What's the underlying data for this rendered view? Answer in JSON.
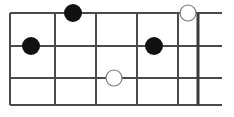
{
  "diagram": {
    "orientation": "horizontal",
    "background_color": "#ffffff",
    "line_color": "#4a4a4a",
    "filled_marker_color": "#111111",
    "open_marker_fill": "#ffffff",
    "open_marker_stroke": "#7a7a7a"
  },
  "chart_data": {
    "type": "scatter",
    "xlabel": "",
    "ylabel": "",
    "xlim": [
      0,
      234
    ],
    "ylim": [
      0,
      117
    ],
    "grid": true,
    "strings": [
      {
        "index": 0,
        "y": 13,
        "x_start": 10,
        "x_end": 222
      },
      {
        "index": 1,
        "y": 46,
        "x_start": 10,
        "x_end": 222
      },
      {
        "index": 2,
        "y": 78,
        "x_start": 10,
        "x_end": 222
      },
      {
        "index": 3,
        "y": 105,
        "x_start": 10,
        "x_end": 222
      }
    ],
    "frets": [
      {
        "index": 0,
        "x": 10,
        "y_start": 13,
        "y_end": 105,
        "thick": false
      },
      {
        "index": 1,
        "x": 55,
        "y_start": 13,
        "y_end": 105,
        "thick": false
      },
      {
        "index": 2,
        "x": 96,
        "y_start": 13,
        "y_end": 105,
        "thick": false
      },
      {
        "index": 3,
        "x": 137,
        "y_start": 13,
        "y_end": 105,
        "thick": false
      },
      {
        "index": 4,
        "x": 178,
        "y_start": 13,
        "y_end": 105,
        "thick": false
      },
      {
        "index": 5,
        "x": 198,
        "y_start": 13,
        "y_end": 105,
        "thick": true
      }
    ],
    "markers": [
      {
        "id": "marker-1",
        "style": "filled",
        "x": 73,
        "y": 13,
        "r": 9,
        "string": 0,
        "fret": 2
      },
      {
        "id": "marker-2",
        "style": "open",
        "x": 188,
        "y": 13,
        "r": 8,
        "string": 0,
        "fret": 5
      },
      {
        "id": "marker-3",
        "style": "filled",
        "x": 31,
        "y": 46,
        "r": 9,
        "string": 1,
        "fret": 1
      },
      {
        "id": "marker-4",
        "style": "filled",
        "x": 154,
        "y": 46,
        "r": 9,
        "string": 1,
        "fret": 4
      },
      {
        "id": "marker-5",
        "style": "open",
        "x": 114,
        "y": 78,
        "r": 8,
        "string": 2,
        "fret": 3
      }
    ]
  }
}
